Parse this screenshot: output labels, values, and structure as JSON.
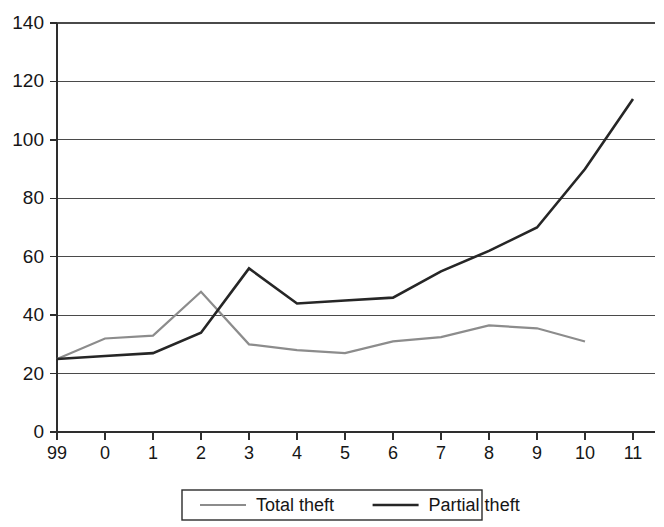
{
  "chart_data": {
    "type": "line",
    "title": "",
    "subtitle": "",
    "xlabel": "",
    "ylabel": "",
    "categories": [
      "99",
      "0",
      "1",
      "2",
      "3",
      "4",
      "5",
      "6",
      "7",
      "8",
      "9",
      "10",
      "11"
    ],
    "x_tick_labels": [
      "99",
      "0",
      "1",
      "2",
      "3",
      "4",
      "5",
      "6",
      "7",
      "8",
      "9",
      "10",
      "11"
    ],
    "y_tick_labels": [
      "0",
      "20",
      "40",
      "60",
      "80",
      "100",
      "120",
      "140"
    ],
    "y_ticks": [
      0,
      20,
      40,
      60,
      80,
      100,
      120,
      140
    ],
    "ylim": [
      0,
      140
    ],
    "xlim": [
      0,
      12
    ],
    "grid": "horizontal",
    "legend_position": "bottom-center",
    "series": [
      {
        "name": "Total theft",
        "color": "#8c8c8c",
        "stroke_width": 2.2,
        "values": [
          25,
          32,
          33,
          48,
          30,
          28,
          27,
          31,
          32.5,
          36.5,
          35.5,
          31,
          null
        ]
      },
      {
        "name": "Partial theft",
        "color": "#262626",
        "stroke_width": 2.6,
        "values": [
          25,
          26,
          27,
          34,
          56,
          44,
          45,
          46,
          55,
          62,
          70,
          90,
          114
        ]
      }
    ]
  },
  "legend": {
    "items": [
      {
        "label": "Total theft",
        "color": "#8c8c8c"
      },
      {
        "label": "Partial theft",
        "color": "#262626"
      }
    ]
  },
  "axes": {
    "y_axis_name": "value-axis",
    "x_axis_name": "year-axis"
  }
}
